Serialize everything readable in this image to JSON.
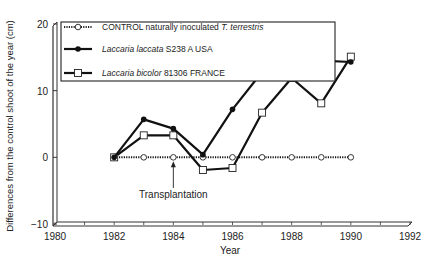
{
  "chart_data": {
    "type": "line",
    "title": "",
    "xlabel": "Year",
    "ylabel": "Differences from the control shoot of the year (cm)",
    "xlim": [
      1980,
      1992
    ],
    "ylim": [
      -10,
      20
    ],
    "xticks": [
      "1980",
      "1982",
      "1984",
      "1986",
      "1988",
      "1990",
      "1992"
    ],
    "yticks": [
      "20",
      "10",
      "0",
      "−10"
    ],
    "grid": false,
    "legend_position": "upper-left",
    "x": [
      1982,
      1983,
      1984,
      1985,
      1986,
      1987,
      1988,
      1989,
      1990
    ],
    "series": [
      {
        "name": "CONTROL naturally inoculated T. terrestris",
        "name_plain": "CONTROL naturally inoculated ",
        "name_italic": "T. terrestris",
        "marker": "open-circle",
        "linestyle": "dotted",
        "values": [
          0,
          0,
          0,
          0,
          0,
          0,
          0,
          0,
          0
        ]
      },
      {
        "name": "Laccaria laccata S238 A USA",
        "name_italic": "Laccaria laccata",
        "name_plain": " S238 A USA",
        "marker": "filled-circle",
        "linestyle": "solid",
        "values": [
          0,
          5.7,
          4.3,
          0.4,
          7.2,
          12.8,
          17.3,
          14.5,
          14.3
        ]
      },
      {
        "name": "Laccaria bicolor 81306 FRANCE",
        "name_italic": "Laccaria bicolor",
        "name_plain": " 81306 FRANCE",
        "marker": "open-square",
        "linestyle": "solid",
        "values": [
          0,
          3.3,
          3.3,
          -1.9,
          -1.6,
          6.7,
          11.9,
          8.1,
          15.1
        ]
      }
    ],
    "annotations": [
      {
        "text": "Transplantation",
        "x": 1984,
        "arrow_to_y": 0
      }
    ]
  },
  "colors": {
    "line": "#111111",
    "axis": "#333333",
    "text": "#222222"
  }
}
